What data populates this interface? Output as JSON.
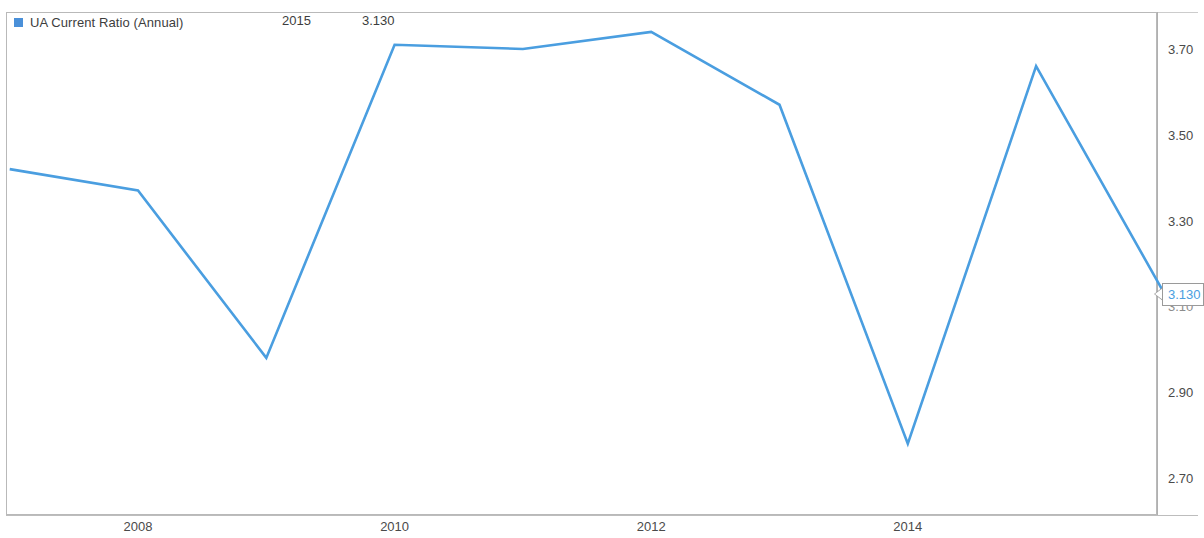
{
  "chart_data": {
    "type": "line",
    "title": "",
    "xlabel": "",
    "ylabel": "",
    "legend_position": "top-left",
    "grid": false,
    "series": [
      {
        "name": "UA Current Ratio (Annual)",
        "color": "#4a9ee0",
        "x": [
          2007,
          2008,
          2009,
          2010,
          2011,
          2012,
          2013,
          2014,
          2015,
          2016
        ],
        "values": [
          3.42,
          3.37,
          2.98,
          3.71,
          3.7,
          3.74,
          3.57,
          2.78,
          3.66,
          3.13
        ]
      }
    ],
    "x_ticks": [
      {
        "label": "2008",
        "value": 2008
      },
      {
        "label": "2010",
        "value": 2010
      },
      {
        "label": "2012",
        "value": 2012
      },
      {
        "label": "2014",
        "value": 2014
      }
    ],
    "y_ticks": [
      {
        "label": "3.70",
        "value": 3.7
      },
      {
        "label": "3.50",
        "value": 3.5
      },
      {
        "label": "3.30",
        "value": 3.3
      },
      {
        "label": "3.10",
        "value": 3.1
      },
      {
        "label": "2.90",
        "value": 2.9
      },
      {
        "label": "2.70",
        "value": 2.7
      }
    ],
    "ylim": [
      2.62,
      3.78
    ],
    "xlim": [
      2006.95,
      2016.0
    ],
    "last_value_callout": "3.130"
  },
  "legend": {
    "series_label": "UA Current Ratio (Annual)",
    "year": "2015",
    "value": "3.130",
    "swatch_color": "#4a90d9"
  },
  "axis": {
    "y_labels": [
      "3.70",
      "3.50",
      "3.30",
      "3.10",
      "2.90",
      "2.70"
    ],
    "x_labels": [
      "2008",
      "2010",
      "2012",
      "2014"
    ]
  },
  "callout": {
    "text": "3.130"
  }
}
